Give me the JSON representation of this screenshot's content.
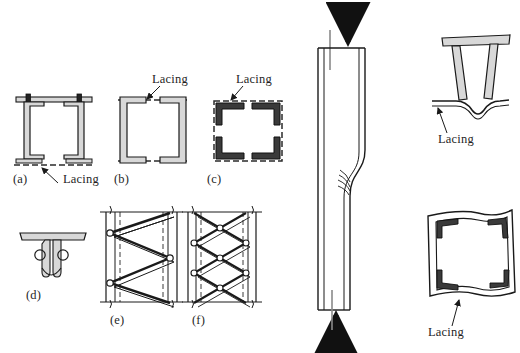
{
  "figure": {
    "kind": "engineering-diagram",
    "background_color": "#ffffff",
    "line_color": "#1a1a1a",
    "fill_color": "#d8d8d8",
    "dashed_color": "#3a3a3a"
  },
  "captions": {
    "a": "(a)",
    "b": "(b)",
    "c": "(c)",
    "d": "(d)",
    "e": "(e)",
    "f": "(f)"
  },
  "annotations": {
    "lacing_a": "Lacing",
    "lacing_b": "Lacing",
    "lacing_c": "Lacing",
    "lacing_right_top": "Lacing",
    "lacing_right_bottom": "Lacing"
  },
  "panels": [
    {
      "id": "a",
      "caption": "(a)",
      "description": "Two channel sections placed back to back with batten plates at top and dashed lacing at bottom",
      "annotation": "Lacing",
      "annotation_target": "bottom dashed lacing line"
    },
    {
      "id": "b",
      "caption": "(b)",
      "description": "Two channel sections toe to toe connected by dashed lacing on both flanges",
      "annotation": "Lacing",
      "annotation_target": "top dashed lacing line"
    },
    {
      "id": "c",
      "caption": "(c)",
      "description": "Four angle sections at the corners of a square box connected by dashed lacing on all four faces",
      "annotation": "Lacing",
      "annotation_target": "top dashed lacing line"
    },
    {
      "id": "d",
      "caption": "(d)",
      "description": "T-section built-up member cross-section with rounded web connectors",
      "annotation": null,
      "annotation_target": null
    },
    {
      "id": "e",
      "caption": "(e)",
      "description": "Elevation of a single lacing system: zig-zag diagonal bars connecting two vertical chords, riveted at node points",
      "annotation": null,
      "annotation_target": null
    },
    {
      "id": "f",
      "caption": "(f)",
      "description": "Elevation of a double lacing system: crossed diagonal bars forming an X pattern between two vertical chords",
      "annotation": null,
      "annotation_target": null
    },
    {
      "id": "column",
      "caption": null,
      "description": "Slender built-up column under axial compression showing an S-shaped local buckle/kink at mid-height; heavy arrows indicate the compressive load applied at the top and bottom ends",
      "annotation": null,
      "annotation_target": null
    },
    {
      "id": "right-top",
      "caption": null,
      "description": "Deformed cross-section of the member in (a) after failure; the bottom lacing has buckled into a wavy shape",
      "annotation": "Lacing",
      "annotation_target": "deformed bottom lacing"
    },
    {
      "id": "right-bottom",
      "caption": null,
      "description": "Deformed cross-section of the box member in (c) after failure; the lacing on all faces has bowed outward",
      "annotation": "Lacing",
      "annotation_target": "deformed bottom lacing"
    }
  ]
}
